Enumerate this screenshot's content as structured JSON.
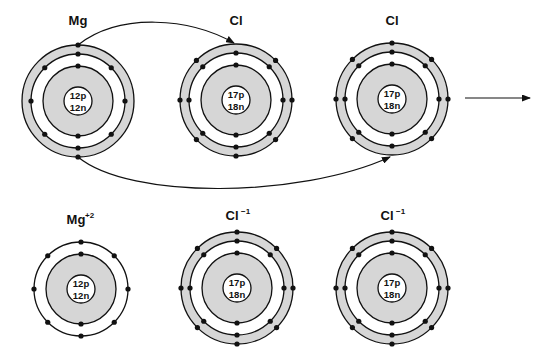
{
  "diagram": {
    "colors": {
      "shell_fill": "#d6d6d6",
      "line": "#111111",
      "background": "#ffffff"
    },
    "reactants": [
      {
        "id": "mg",
        "label": "Mg",
        "charge": "",
        "nucleus_p": "12p",
        "nucleus_n": "12n",
        "cx": 78,
        "cy": 101,
        "shells": [
          2,
          8,
          2
        ],
        "outer_band": true,
        "label_y": 25
      },
      {
        "id": "cl1",
        "label": "Cl",
        "charge": "",
        "nucleus_p": "17p",
        "nucleus_n": "18n",
        "cx": 236,
        "cy": 100,
        "shells": [
          2,
          8,
          7
        ],
        "missing_outer": "top",
        "outer_band": true,
        "label_y": 25
      },
      {
        "id": "cl2",
        "label": "Cl",
        "charge": "",
        "nucleus_p": "17p",
        "nucleus_n": "18n",
        "cx": 392,
        "cy": 99,
        "shells": [
          2,
          8,
          7
        ],
        "missing_outer": "bottom",
        "outer_band": true,
        "label_y": 25
      }
    ],
    "products": [
      {
        "id": "mg_ion",
        "label": "Mg",
        "charge": "+2",
        "nucleus_p": "12p",
        "nucleus_n": "12n",
        "cx": 81,
        "cy": 289,
        "shells": [
          2,
          8
        ],
        "outer_band": false,
        "label_y": 224
      },
      {
        "id": "cl_ion1",
        "label": "Cl",
        "charge": "−1",
        "nucleus_p": "17p",
        "nucleus_n": "18n",
        "cx": 237,
        "cy": 288,
        "shells": [
          2,
          8,
          8
        ],
        "outer_band": true,
        "label_y": 220
      },
      {
        "id": "cl_ion2",
        "label": "Cl",
        "charge": "−1",
        "nucleus_p": "17p",
        "nucleus_n": "18n",
        "cx": 392,
        "cy": 288,
        "shells": [
          2,
          8,
          8
        ],
        "outer_band": true,
        "label_y": 220
      }
    ],
    "transfers": [
      {
        "from": "mg",
        "to": "cl1",
        "description": "electron transfer Mg to Cl (top arc)"
      },
      {
        "from": "mg",
        "to": "cl2",
        "description": "electron transfer Mg to Cl (bottom arc)"
      }
    ],
    "reaction_arrow": {
      "x1": 465,
      "x2": 530,
      "y": 98
    }
  }
}
